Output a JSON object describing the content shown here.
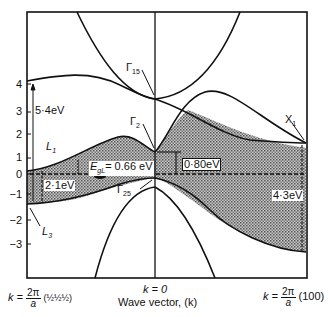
{
  "figure": {
    "type": "band-structure-diagram",
    "y_axis": {
      "ticks": [
        "4",
        "3",
        "2",
        "1",
        "0",
        "−1",
        "−2",
        "−3"
      ],
      "unit": "eV"
    },
    "x_axis": {
      "label": "Wave vector, (k)",
      "left_label": {
        "k": "k =",
        "num": "2π",
        "den": "a",
        "suffix": "(½½½)"
      },
      "center_label": "k = 0",
      "right_label": {
        "k": "k =",
        "num": "2π",
        "den": "a",
        "suffix": "(100)"
      }
    },
    "points": {
      "gamma15": "Γ",
      "gamma15_sub": "15",
      "gamma2": "Γ",
      "gamma2_sub": "2",
      "gamma25": "Γ",
      "gamma25_sub": "25",
      "L1": "L",
      "L1_sub": "1",
      "L3": "L",
      "L3_sub": "3",
      "X1": "X",
      "X1_sub": "1"
    },
    "annotations": {
      "gap_L_54": "5·4eV",
      "gap_L_21": "2·1eV",
      "gap_indirect_E": "E",
      "gap_indirect_sub": "gL",
      "gap_indirect_value": "= 0.66 eV",
      "gap_gamma": "0·80eV",
      "gap_X": "4·3eV"
    },
    "colors": {
      "line": "#111111",
      "shade": "#9a9a9a",
      "background": "#ffffff"
    }
  }
}
